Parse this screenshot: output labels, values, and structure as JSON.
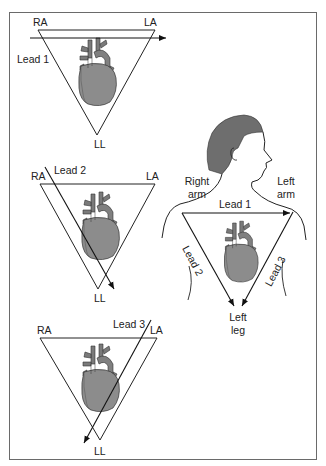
{
  "figure": {
    "panels": [
      {
        "id": "lead-1-panel",
        "vertices": {
          "ra": "RA",
          "la": "LA",
          "ll": "LL"
        },
        "lead_label": "Lead 1"
      },
      {
        "id": "lead-2-panel",
        "vertices": {
          "ra": "RA",
          "la": "LA",
          "ll": "LL"
        },
        "lead_label": "Lead 2"
      },
      {
        "id": "lead-3-panel",
        "vertices": {
          "ra": "RA",
          "la": "LA",
          "ll": "LL"
        },
        "lead_label": "Lead 3"
      }
    ],
    "body_diagram": {
      "right_arm": "Right arm",
      "right_arm_line1": "Right",
      "right_arm_line2": "arm",
      "left_arm_line1": "Left",
      "left_arm_line2": "arm",
      "left_leg_line1": "Left",
      "left_leg_line2": "leg",
      "lead1": "Lead 1",
      "lead2": "Lead 2",
      "lead3": "Lead 3"
    },
    "colors": {
      "line": "#222222",
      "heart_fill": "#8c8c8c",
      "heart_dark": "#6e6e6e",
      "hair": "#6a6a6a",
      "frame": "#6a6a6a"
    }
  }
}
